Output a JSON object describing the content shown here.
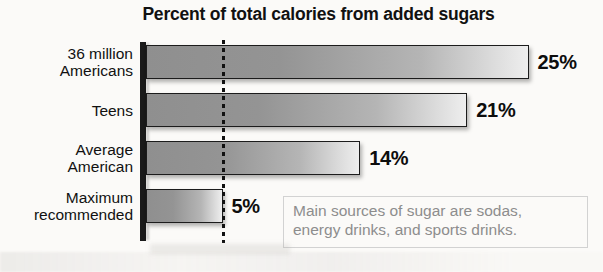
{
  "chart_data": {
    "type": "bar",
    "orientation": "horizontal",
    "title": "Percent of total calories from added sugars",
    "xlabel": "",
    "ylabel": "",
    "unit": "%",
    "categories": [
      "36 million\nAmericans",
      "Teens",
      "Average\nAmerican",
      "Maximum\nrecommended"
    ],
    "values": [
      25,
      21,
      14,
      5
    ],
    "value_labels": [
      "25%",
      "21%",
      "14%",
      "5%"
    ],
    "xlim": [
      0,
      25
    ],
    "grid": false,
    "legend": false,
    "reference_line": {
      "value": 5,
      "style": "dotted",
      "color": "#111111"
    },
    "annotation": "Main sources of sugar are sodas,\nenergy drinks, and sports drinks.",
    "colors": {
      "bar_fill_dark": "#8f8f8f",
      "bar_fill_light": "#eeeeee",
      "bar_outline": "#1c1c1c",
      "axis": "#1a1a1a",
      "title_text": "#111111",
      "value_text": "#0d0d0d",
      "annotation_text": "#8d8d8d",
      "annotation_border": "#d2d2d2",
      "background": "#fbfaf8"
    }
  }
}
